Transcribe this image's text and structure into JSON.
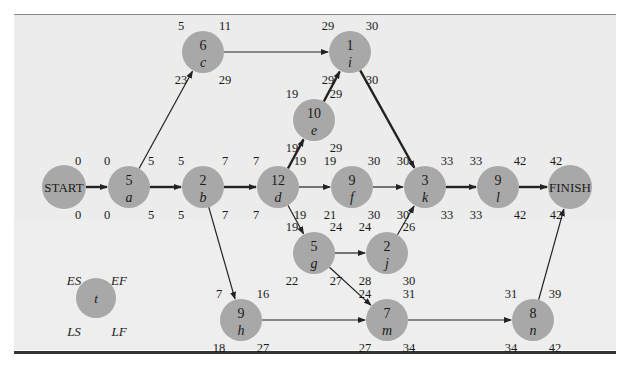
{
  "figure": {
    "type": "project network (CPM/PERT activity-on-node)",
    "legend": {
      "node_label": "t",
      "top_left": "ES",
      "top_right": "EF",
      "bottom_left": "LS",
      "bottom_right": "LF"
    },
    "nodes": [
      {
        "id": "START",
        "label": "START",
        "duration": "",
        "es": "0",
        "ef": "",
        "ls": "0",
        "lf": "",
        "x": 64,
        "y": 187
      },
      {
        "id": "a",
        "label": "a",
        "duration": "5",
        "es": "0",
        "ef": "5",
        "ls": "0",
        "lf": "5",
        "x": 129,
        "y": 187
      },
      {
        "id": "b",
        "label": "b",
        "duration": "2",
        "es": "5",
        "ef": "7",
        "ls": "5",
        "lf": "7",
        "x": 203,
        "y": 187
      },
      {
        "id": "c",
        "label": "c",
        "duration": "6",
        "es": "5",
        "ef": "11",
        "ls": "23",
        "lf": "29",
        "x": 203,
        "y": 52
      },
      {
        "id": "d",
        "label": "d",
        "duration": "12",
        "es": "7",
        "ef": "19",
        "ls": "7",
        "lf": "19",
        "x": 278,
        "y": 187
      },
      {
        "id": "e",
        "label": "e",
        "duration": "10",
        "es": "19",
        "ef": "29",
        "ls": "19",
        "lf": "29",
        "x": 314,
        "y": 120
      },
      {
        "id": "f",
        "label": "f",
        "duration": "9",
        "es": "19",
        "ef": "30",
        "ls": "21",
        "lf": "30",
        "x": 352,
        "y": 187
      },
      {
        "id": "g",
        "label": "g",
        "duration": "5",
        "es": "19",
        "ef": "24",
        "ls": "22",
        "lf": "27",
        "x": 314,
        "y": 253
      },
      {
        "id": "h",
        "label": "h",
        "duration": "9",
        "es": "7",
        "ef": "16",
        "ls": "18",
        "lf": "27",
        "x": 241,
        "y": 320
      },
      {
        "id": "i",
        "label": "i",
        "duration": "1",
        "es": "29",
        "ef": "30",
        "ls": "29",
        "lf": "30",
        "x": 350,
        "y": 52
      },
      {
        "id": "j",
        "label": "j",
        "duration": "2",
        "es": "24",
        "ef": "26",
        "ls": "28",
        "lf": "30",
        "x": 387,
        "y": 253
      },
      {
        "id": "k",
        "label": "k",
        "duration": "3",
        "es": "30",
        "ef": "33",
        "ls": "30",
        "lf": "33",
        "x": 425,
        "y": 187
      },
      {
        "id": "l",
        "label": "l",
        "duration": "9",
        "es": "33",
        "ef": "42",
        "ls": "33",
        "lf": "42",
        "x": 498,
        "y": 187
      },
      {
        "id": "m",
        "label": "m",
        "duration": "7",
        "es": "24",
        "ef": "31",
        "ls": "27",
        "lf": "34",
        "x": 387,
        "y": 320
      },
      {
        "id": "n",
        "label": "n",
        "duration": "8",
        "es": "31",
        "ef": "39",
        "ls": "34",
        "lf": "42",
        "x": 533,
        "y": 320
      },
      {
        "id": "FINISH",
        "label": "FINISH",
        "duration": "",
        "es": "42",
        "ef": "",
        "ls": "42",
        "lf": "",
        "x": 570,
        "y": 187
      }
    ],
    "edges": [
      {
        "from": "START",
        "to": "a",
        "critical": true
      },
      {
        "from": "a",
        "to": "b",
        "critical": true
      },
      {
        "from": "a",
        "to": "c",
        "critical": false
      },
      {
        "from": "b",
        "to": "d",
        "critical": true
      },
      {
        "from": "b",
        "to": "h",
        "critical": false
      },
      {
        "from": "c",
        "to": "i",
        "critical": false
      },
      {
        "from": "d",
        "to": "e",
        "critical": true
      },
      {
        "from": "d",
        "to": "f",
        "critical": false
      },
      {
        "from": "d",
        "to": "g",
        "critical": false
      },
      {
        "from": "e",
        "to": "i",
        "critical": true
      },
      {
        "from": "i",
        "to": "k",
        "critical": true
      },
      {
        "from": "f",
        "to": "k",
        "critical": false
      },
      {
        "from": "g",
        "to": "j",
        "critical": false
      },
      {
        "from": "g",
        "to": "m",
        "critical": false
      },
      {
        "from": "j",
        "to": "k",
        "critical": false
      },
      {
        "from": "h",
        "to": "m",
        "critical": false
      },
      {
        "from": "k",
        "to": "l",
        "critical": true
      },
      {
        "from": "l",
        "to": "FINISH",
        "critical": true
      },
      {
        "from": "m",
        "to": "n",
        "critical": false
      },
      {
        "from": "n",
        "to": "FINISH",
        "critical": false
      }
    ]
  },
  "colors": {
    "node_fill": "#a8a8a8",
    "panel_bg": "#ececec",
    "edge": "#222222"
  }
}
